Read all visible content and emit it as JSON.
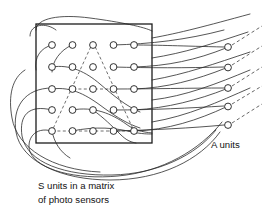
{
  "figure": {
    "type": "neural-network-schematic",
    "title_present": false,
    "background_color": "#ffffff",
    "ink_color": "#1c1c1c",
    "width": 272,
    "height": 220
  },
  "labels": {
    "a_units": "A units",
    "caption_line1": "S units in a matrix",
    "caption_line2": "of photo sensors"
  },
  "sensor_matrix": {
    "name": "s-unit-matrix",
    "rows": 5,
    "cols": 5,
    "box": {
      "x": 36,
      "y": 24,
      "width": 116,
      "height": 119
    },
    "circle_radius": 3.4,
    "col_x": [
      52,
      72.5,
      93,
      113.5,
      134
    ],
    "row_y": [
      45,
      67,
      89,
      110,
      131
    ]
  },
  "a_units": {
    "name": "a-unit-column",
    "count": 5,
    "circle_radius": 3.4,
    "x": 228,
    "y": [
      47,
      67.5,
      88,
      106.5,
      125
    ]
  },
  "output_lines": {
    "style": "dashed",
    "count": 5,
    "dx": 26,
    "dy": -17
  },
  "overlay_triangle": {
    "name": "dashed-stimulus-triangle",
    "style": "dashed",
    "apex": {
      "x": 93,
      "y": 43
    },
    "left": {
      "x": 52,
      "y": 131
    },
    "right": {
      "x": 134,
      "y": 131
    },
    "midline_y": 89
  },
  "connections": {
    "description": "curved wires from S units to A units",
    "solid_count": 17,
    "sweeping_arcs_below": 3
  }
}
